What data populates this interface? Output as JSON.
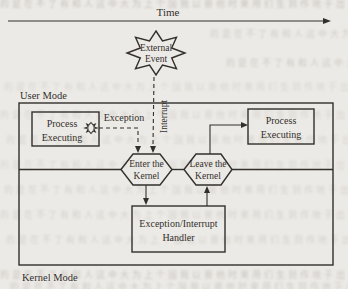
{
  "figure": {
    "time_label": "Time",
    "user_mode_label": "User Mode",
    "kernel_mode_label": "Kernel Mode",
    "external_event": {
      "line1": "External",
      "line2": "Event"
    },
    "exception_label": "Exception",
    "interrupt_label": "Interrupt",
    "process_left": {
      "line1": "Process",
      "line2": "Executing"
    },
    "process_right": {
      "line1": "Process",
      "line2": "Executing"
    },
    "enter_kernel": {
      "line1": "Enter the",
      "line2": "Kernel"
    },
    "leave_kernel": {
      "line1": "Leave the",
      "line2": "Kernel"
    },
    "handler": {
      "line1": "Exception/Interrupt",
      "line2": "Handler"
    }
  },
  "colors": {
    "ink": "#332f2b",
    "paper": "#eceae6",
    "bleedthrough": "#a9a29a"
  },
  "noise": {
    "glyphs": "的是在不了有和人这中大为上个国我以要他时来用们生到作地于出就分对成会可主发年动的是在不了有和人这中"
  }
}
